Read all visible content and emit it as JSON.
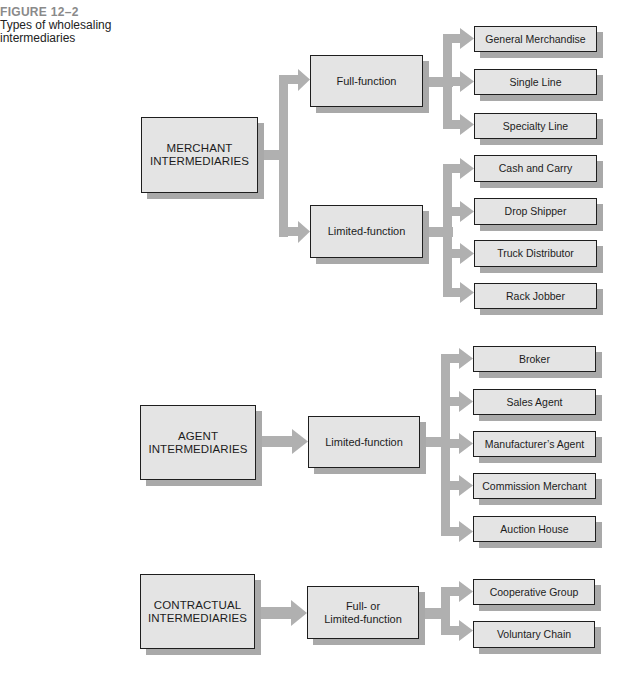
{
  "figure": {
    "number": "FIGURE 12–2",
    "title": "Types of wholesaling intermediaries"
  },
  "colors": {
    "box_fill": "#e4e4e4",
    "box_border": "#1e1e1e",
    "shadow": "#a9a9a9",
    "connector": "#b0b0b0",
    "figure_number": "#8a8a8a"
  },
  "groups": [
    {
      "label": "MERCHANT\nINTERMEDIARIES",
      "functions": [
        {
          "label": "Full-function",
          "types": [
            "General Merchandise",
            "Single Line",
            "Specialty Line"
          ]
        },
        {
          "label": "Limited-function",
          "types": [
            "Cash and Carry",
            "Drop Shipper",
            "Truck Distributor",
            "Rack Jobber"
          ]
        }
      ]
    },
    {
      "label": "AGENT\nINTERMEDIARIES",
      "functions": [
        {
          "label": "Limited-function",
          "types": [
            "Broker",
            "Sales Agent",
            "Manufacturer’s Agent",
            "Commission Merchant",
            "Auction House"
          ]
        }
      ]
    },
    {
      "label": "CONTRACTUAL\nINTERMEDIARIES",
      "functions": [
        {
          "label": "Full- or\nLimited-function",
          "types": [
            "Cooperative Group",
            "Voluntary Chain"
          ]
        }
      ]
    }
  ]
}
